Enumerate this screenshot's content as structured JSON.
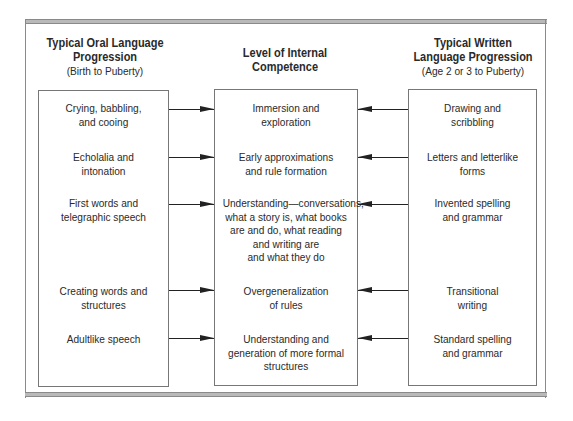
{
  "columns": {
    "oral": {
      "title_line1": "Typical Oral Language",
      "title_line2": "Progression",
      "subtitle": "(Birth to Puberty)",
      "items": [
        {
          "line1": "Crying, babbling,",
          "line2": "and cooing"
        },
        {
          "line1": "Echolalia and",
          "line2": "intonation"
        },
        {
          "line1": "First words and",
          "line2": "telegraphic speech"
        },
        {
          "line1": "Creating words and",
          "line2": "structures"
        },
        {
          "line1": "Adultlike speech",
          "line2": ""
        }
      ]
    },
    "internal": {
      "title_line1": "Level of Internal",
      "title_line2": "Competence",
      "items": [
        {
          "lines": [
            "Immersion and",
            "exploration"
          ]
        },
        {
          "lines": [
            "Early approximations",
            "and rule formation"
          ]
        },
        {
          "lines": [
            "Understanding—conversations,",
            "what a story is, what books",
            "are and do, what reading",
            "and writing are",
            "and what they do"
          ]
        },
        {
          "lines": [
            "Overgeneralization",
            "of rules"
          ]
        },
        {
          "lines": [
            "Understanding and",
            "generation of more formal",
            "structures"
          ]
        }
      ]
    },
    "written": {
      "title_line1": "Typical Written",
      "title_line2": "Language Progression",
      "subtitle": "(Age 2 or 3 to Puberty)",
      "items": [
        {
          "line1": "Drawing and",
          "line2": "scribbling"
        },
        {
          "line1": "Letters and letterlike",
          "line2": "forms"
        },
        {
          "line1": "Invented spelling",
          "line2": "and grammar"
        },
        {
          "line1": "Transitional",
          "line2": "writing"
        },
        {
          "line1": "Standard spelling",
          "line2": "and grammar"
        }
      ]
    }
  },
  "arrows": {
    "oral_to_internal": "right-pointing",
    "written_to_internal": "left-pointing"
  },
  "colors": {
    "frame_bar": "#b9b9b9",
    "border": "#777777",
    "text": "#2a2a2a"
  }
}
